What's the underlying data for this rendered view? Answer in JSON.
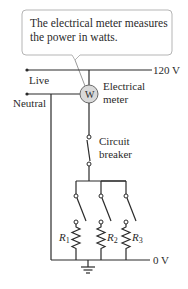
{
  "callout": {
    "line1": "The electrical meter measures",
    "line2": "the power in watts."
  },
  "labels": {
    "live": "Live",
    "neutral": "Neutral",
    "live_voltage": "120 V",
    "ground_voltage": "0 V",
    "meter_line1": "Electrical",
    "meter_line2": "meter",
    "meter_symbol": "W",
    "breaker_line1": "Circuit",
    "breaker_line2": "breaker"
  },
  "resistors": [
    {
      "letter": "R",
      "subscript": "1"
    },
    {
      "letter": "R",
      "subscript": "2"
    },
    {
      "letter": "R",
      "subscript": "3"
    }
  ],
  "colors": {
    "wire": "#2a2a2a",
    "meter_fill": "#d9d9d9",
    "callout_border": "#b5b5b5",
    "background": "#ffffff"
  }
}
